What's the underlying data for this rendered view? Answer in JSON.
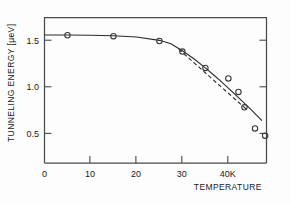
{
  "chart_data": {
    "type": "scatter",
    "title": "",
    "xlabel": "TEMPERATURE",
    "ylabel": "TUNNELING ENERGY [µeV]",
    "xunit": "K",
    "xlim": [
      0,
      48.3
    ],
    "ylim": [
      0.17,
      1.69
    ],
    "grid": false,
    "legend": "none",
    "xticks": [
      0,
      10,
      20,
      30,
      40
    ],
    "xticklabels": [
      "0",
      "10",
      "20",
      "30",
      "40K"
    ],
    "yticks": [
      0.5,
      1.0,
      1.5
    ],
    "yticklabels": [
      "0.5",
      "1.0",
      "1.5"
    ],
    "points": [
      {
        "x": 5.0,
        "y": 1.5
      },
      {
        "x": 15.0,
        "y": 1.49
      },
      {
        "x": 25.0,
        "y": 1.44
      },
      {
        "x": 30.0,
        "y": 1.33
      },
      {
        "x": 35.0,
        "y": 1.16
      },
      {
        "x": 40.0,
        "y": 1.05
      },
      {
        "x": 42.2,
        "y": 0.91
      },
      {
        "x": 43.5,
        "y": 0.75
      },
      {
        "x": 45.8,
        "y": 0.53
      },
      {
        "x": 48.0,
        "y": 0.455
      }
    ],
    "series": [
      {
        "name": "solid fit curve",
        "style": "solid",
        "points": [
          {
            "x": 0.0,
            "y": 1.503
          },
          {
            "x": 5.0,
            "y": 1.503
          },
          {
            "x": 10.0,
            "y": 1.5
          },
          {
            "x": 15.0,
            "y": 1.495
          },
          {
            "x": 20.0,
            "y": 1.482
          },
          {
            "x": 25.0,
            "y": 1.447
          },
          {
            "x": 27.5,
            "y": 1.412
          },
          {
            "x": 30.0,
            "y": 1.338
          },
          {
            "x": 32.5,
            "y": 1.255
          },
          {
            "x": 35.0,
            "y": 1.16
          },
          {
            "x": 37.5,
            "y": 1.058
          },
          {
            "x": 40.0,
            "y": 0.95
          },
          {
            "x": 42.5,
            "y": 0.838
          },
          {
            "x": 45.0,
            "y": 0.722
          },
          {
            "x": 46.5,
            "y": 0.65
          },
          {
            "x": 47.3,
            "y": 0.61
          }
        ]
      },
      {
        "name": "dashed straight fit",
        "style": "dashed",
        "points": [
          {
            "x": 29.2,
            "y": 1.355
          },
          {
            "x": 44.2,
            "y": 0.718
          }
        ]
      }
    ]
  },
  "axes": {
    "y_axis_label": "TUNNELING ENERGY [µeV]",
    "x_axis_label": "TEMPERATURE"
  }
}
